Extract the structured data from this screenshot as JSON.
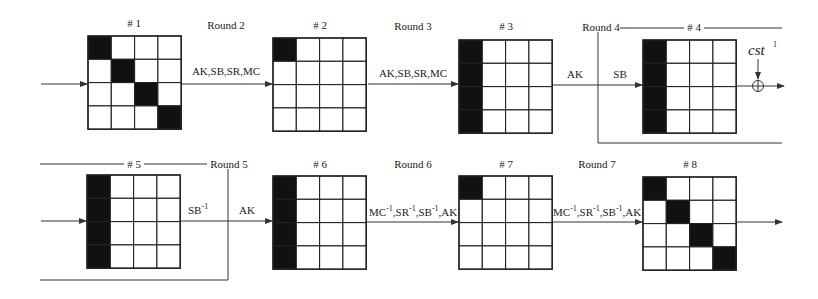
{
  "diagram": {
    "title": "",
    "colors": {
      "active_cell": "#111111",
      "inactive_cell": "#ffffff",
      "line": "#222222"
    },
    "states": [
      {
        "id": "1",
        "label": "# 1",
        "x": 88,
        "y": 36,
        "active": [
          [
            0,
            0
          ],
          [
            1,
            1
          ],
          [
            2,
            2
          ],
          [
            3,
            3
          ]
        ]
      },
      {
        "id": "2",
        "label": "# 2",
        "x": 273,
        "y": 38,
        "active": [
          [
            0,
            0
          ]
        ]
      },
      {
        "id": "3",
        "label": "# 3",
        "x": 459,
        "y": 40,
        "active": [
          [
            0,
            0
          ],
          [
            1,
            0
          ],
          [
            2,
            0
          ],
          [
            3,
            0
          ]
        ]
      },
      {
        "id": "4",
        "label": "# 4",
        "x": 643,
        "y": 40,
        "active": [
          [
            0,
            0
          ],
          [
            1,
            0
          ],
          [
            2,
            0
          ],
          [
            3,
            0
          ]
        ]
      },
      {
        "id": "5",
        "label": "# 5",
        "x": 87,
        "y": 175,
        "active": [
          [
            0,
            0
          ],
          [
            1,
            0
          ],
          [
            2,
            0
          ],
          [
            3,
            0
          ]
        ]
      },
      {
        "id": "6",
        "label": "# 6",
        "x": 273,
        "y": 176,
        "active": [
          [
            0,
            0
          ],
          [
            1,
            0
          ],
          [
            2,
            0
          ],
          [
            3,
            0
          ]
        ]
      },
      {
        "id": "7",
        "label": "# 7",
        "x": 459,
        "y": 176,
        "active": [
          [
            0,
            0
          ]
        ]
      },
      {
        "id": "8",
        "label": "# 8",
        "x": 643,
        "y": 177,
        "active": [
          [
            0,
            0
          ],
          [
            1,
            1
          ],
          [
            2,
            2
          ],
          [
            3,
            3
          ]
        ]
      }
    ],
    "rounds": {
      "r2": {
        "title": "Round 2",
        "ops": "AK,SB,SR,MC"
      },
      "r3": {
        "title": "Round 3",
        "ops": "AK,SB,SR,MC"
      },
      "r4": {
        "title": "Round 4",
        "op_ak": "AK",
        "op_sb": "SB"
      },
      "r5": {
        "title": "Round 5",
        "op_sbinv": "SB",
        "op_sbinv_sup": "-1",
        "op_ak": "AK"
      },
      "r6": {
        "title": "Round 6",
        "ops": [
          "MC",
          "SR",
          "SB",
          "AK"
        ],
        "sup": "-1"
      },
      "r7": {
        "title": "Round 7",
        "ops": [
          "MC",
          "SR",
          "SB",
          "AK"
        ],
        "sup": "-1"
      }
    },
    "constant": {
      "symbol": "cst",
      "superscript": "1",
      "operator": "⊕"
    }
  }
}
